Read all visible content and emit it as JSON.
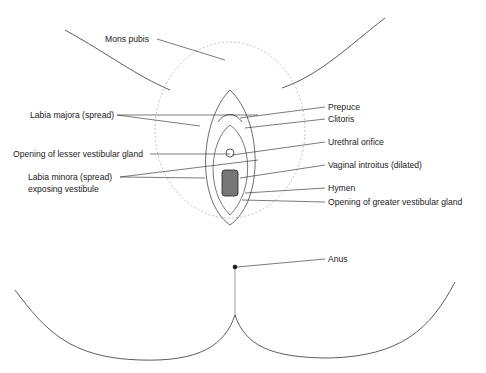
{
  "figure": {
    "type": "anatomical line diagram",
    "labels": [
      {
        "id": "mons-pubis",
        "text": "Mons pubis",
        "x": 105,
        "y": 35
      },
      {
        "id": "labia-majora",
        "text": "Labia majora (spread)",
        "x": 30,
        "y": 111
      },
      {
        "id": "prepuce",
        "text": "Prepuce",
        "x": 328,
        "y": 103
      },
      {
        "id": "clitoris",
        "text": "Clitoris",
        "x": 328,
        "y": 115
      },
      {
        "id": "opening-lesser-vestibular-gland",
        "text": "Opening of lesser vestibular gland",
        "x": 13,
        "y": 150
      },
      {
        "id": "urethral-orifice",
        "text": "Urethral orifice",
        "x": 328,
        "y": 138
      },
      {
        "id": "labia-minora",
        "text": "Labia minora (spread)",
        "x": 28,
        "y": 173
      },
      {
        "id": "labia-minora-line2",
        "text": "exposing vestibule",
        "x": 28,
        "y": 185
      },
      {
        "id": "vaginal-introitus",
        "text": "Vaginal introitus (dilated)",
        "x": 328,
        "y": 161
      },
      {
        "id": "hymen",
        "text": "Hymen",
        "x": 328,
        "y": 184
      },
      {
        "id": "opening-greater-vestibular-gland",
        "text": "Opening of greater vestibular gland",
        "x": 328,
        "y": 198
      },
      {
        "id": "anus",
        "text": "Anus",
        "x": 328,
        "y": 255
      }
    ]
  }
}
